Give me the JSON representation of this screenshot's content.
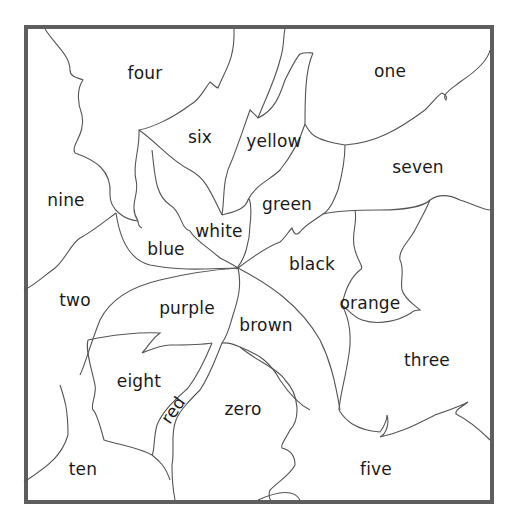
{
  "puzzle": {
    "type": "color-by-word region puzzle",
    "regions": [
      {
        "id": "four",
        "label": "four",
        "x": 145,
        "y": 73
      },
      {
        "id": "one",
        "label": "one",
        "x": 390,
        "y": 71
      },
      {
        "id": "six",
        "label": "six",
        "x": 200,
        "y": 137
      },
      {
        "id": "yellow",
        "label": "yellow",
        "x": 274,
        "y": 141
      },
      {
        "id": "seven",
        "label": "seven",
        "x": 418,
        "y": 167
      },
      {
        "id": "nine",
        "label": "nine",
        "x": 66,
        "y": 200
      },
      {
        "id": "green",
        "label": "green",
        "x": 287,
        "y": 204
      },
      {
        "id": "white",
        "label": "white",
        "x": 219,
        "y": 231
      },
      {
        "id": "blue",
        "label": "blue",
        "x": 166,
        "y": 249
      },
      {
        "id": "black",
        "label": "black",
        "x": 312,
        "y": 264
      },
      {
        "id": "two",
        "label": "two",
        "x": 75,
        "y": 300
      },
      {
        "id": "orange",
        "label": "orange",
        "x": 370,
        "y": 303
      },
      {
        "id": "purple",
        "label": "purple",
        "x": 187,
        "y": 308
      },
      {
        "id": "brown",
        "label": "brown",
        "x": 266,
        "y": 325
      },
      {
        "id": "three",
        "label": "three",
        "x": 427,
        "y": 360
      },
      {
        "id": "eight",
        "label": "eight",
        "x": 139,
        "y": 381
      },
      {
        "id": "red",
        "label": "red",
        "x": 173,
        "y": 410,
        "rotate": -55
      },
      {
        "id": "zero",
        "label": "zero",
        "x": 243,
        "y": 409
      },
      {
        "id": "ten",
        "label": "ten",
        "x": 83,
        "y": 469
      },
      {
        "id": "five",
        "label": "five",
        "x": 376,
        "y": 469
      }
    ]
  },
  "colors": {
    "frame_border": "#5e5e5e",
    "line": "#555555",
    "text": "#1a1a1a",
    "background": "#ffffff"
  }
}
